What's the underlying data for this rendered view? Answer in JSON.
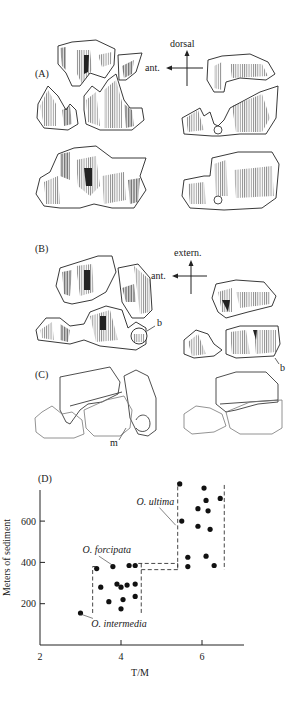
{
  "figure": {
    "panels": {
      "A": {
        "label": "(A)",
        "compass": {
          "up": "dorsal",
          "left": "ant."
        }
      },
      "B": {
        "label": "(B)",
        "compass": {
          "up": "extern.",
          "left": "ant."
        },
        "marker_left": "b",
        "marker_right": "b"
      },
      "C": {
        "label": "(C)",
        "marker": "m"
      },
      "D": {
        "label": "(D)"
      }
    }
  },
  "chart_data": {
    "type": "scatter",
    "title": "",
    "panel_label": "(D)",
    "xlabel": "T/M",
    "ylabel": "Meters of sediment",
    "xlim": [
      2,
      7
    ],
    "ylim": [
      0,
      800
    ],
    "xticks": [
      2,
      4,
      6
    ],
    "yticks": [
      200,
      400,
      600
    ],
    "grid": false,
    "legend": null,
    "series": [
      {
        "name": "O. intermedia",
        "points": [
          [
            3.0,
            155
          ]
        ]
      },
      {
        "name": "O. forcipata",
        "points": [
          [
            3.4,
            370
          ],
          [
            3.8,
            380
          ],
          [
            4.2,
            385
          ],
          [
            4.35,
            385
          ],
          [
            3.5,
            280
          ],
          [
            3.9,
            295
          ],
          [
            4.0,
            280
          ],
          [
            4.15,
            290
          ],
          [
            4.35,
            295
          ],
          [
            3.7,
            210
          ],
          [
            4.05,
            220
          ],
          [
            4.35,
            235
          ],
          [
            4.0,
            175
          ]
        ]
      },
      {
        "name": "O. ultima",
        "points": [
          [
            5.45,
            780
          ],
          [
            6.05,
            760
          ],
          [
            6.1,
            700
          ],
          [
            6.45,
            710
          ],
          [
            5.9,
            660
          ],
          [
            6.15,
            650
          ],
          [
            5.5,
            600
          ],
          [
            5.9,
            575
          ],
          [
            6.2,
            560
          ],
          [
            5.65,
            425
          ],
          [
            6.1,
            430
          ],
          [
            5.65,
            380
          ],
          [
            6.3,
            385
          ]
        ]
      }
    ],
    "ranges": [
      {
        "name": "O. forcipata range",
        "x": [
          3.3,
          4.5
        ],
        "y": [
          155,
          380
        ],
        "style": "dashed"
      },
      {
        "name": "transition",
        "x": [
          4.5,
          5.4
        ],
        "y": [
          365,
          395
        ],
        "style": "dashed"
      },
      {
        "name": "O. ultima range",
        "x": [
          5.4,
          6.55
        ],
        "y": [
          365,
          785
        ],
        "style": "dashed"
      }
    ],
    "annotations": [
      {
        "text": "O. ultima",
        "italic": true,
        "x": 4.85,
        "y": 680,
        "points_to": [
          5.35,
          580
        ]
      },
      {
        "text": "O. forcipata",
        "italic": true,
        "x": 3.65,
        "y": 445,
        "points_to": [
          3.8,
          385
        ]
      },
      {
        "text": "O. intermedia",
        "italic": true,
        "x": 3.95,
        "y": 85,
        "points_to": [
          3.0,
          150
        ]
      }
    ]
  }
}
